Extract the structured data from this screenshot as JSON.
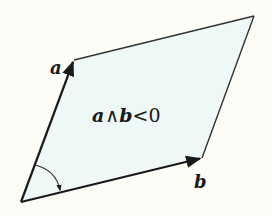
{
  "diagram": {
    "colors": {
      "background": "#fdfdf8",
      "fill": "#eef8f6",
      "stroke": "#1a1a1a"
    },
    "vertices": {
      "origin": [
        21,
        202
      ],
      "a_tip": [
        74,
        60
      ],
      "b_tip": [
        202,
        158
      ],
      "far": [
        254,
        16
      ]
    },
    "labels": {
      "vector_a": "a",
      "vector_b": "b",
      "expression": {
        "a": "a",
        "wedge": "∧",
        "b": "b",
        "rel": "<0"
      }
    },
    "angle_arc": {
      "from": "a",
      "to": "b",
      "direction": "clockwise"
    }
  }
}
